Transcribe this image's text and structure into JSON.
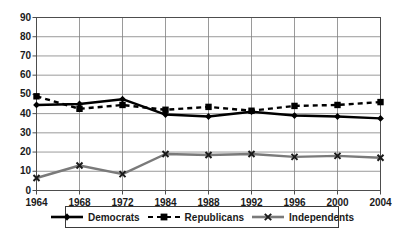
{
  "chart_data": {
    "type": "line",
    "title": "",
    "xlabel": "",
    "ylabel": "",
    "x": [
      "1964",
      "1968",
      "1972",
      "1984",
      "1988",
      "1992",
      "1996",
      "2000",
      "2004"
    ],
    "categories": [
      "1964",
      "1968",
      "1972",
      "1984",
      "1988",
      "1992",
      "1996",
      "2000",
      "2004"
    ],
    "ylim": [
      0,
      90
    ],
    "yticks": [
      "0",
      "10",
      "20",
      "30",
      "40",
      "50",
      "60",
      "70",
      "80",
      "90"
    ],
    "grid": true,
    "legend_position": "bottom",
    "series": [
      {
        "name": "Democrats",
        "values": [
          44.5,
          45,
          47.5,
          39.5,
          38.5,
          41,
          39,
          38.5,
          37.5
        ],
        "color": "#000000",
        "style": "solid",
        "marker": "diamond"
      },
      {
        "name": "Republicans",
        "values": [
          49,
          42.5,
          44.5,
          42,
          43.5,
          41.5,
          44,
          44.5,
          46
        ],
        "color": "#000000",
        "style": "dashed",
        "marker": "square"
      },
      {
        "name": "Independents",
        "values": [
          6.5,
          13,
          8.5,
          19,
          18.5,
          19,
          17.5,
          18,
          17
        ],
        "color": "#7a7a7a",
        "style": "solid",
        "marker": "x"
      }
    ]
  },
  "legend": {
    "items": [
      {
        "label": "Democrats"
      },
      {
        "label": "Republicans"
      },
      {
        "label": "Independents"
      }
    ]
  },
  "colors": {
    "axis": "#4d4d4d",
    "grid": "#808080",
    "democrats": "#000000",
    "republicans": "#000000",
    "independents": "#7a7a7a",
    "background": "#ffffff"
  }
}
